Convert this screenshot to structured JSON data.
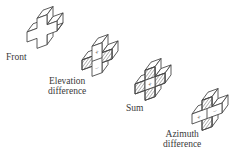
{
  "figure": {
    "type": "monopulse-antenna-quadrants",
    "stroke_color": "#444444",
    "background": "#ffffff",
    "panels": [
      {
        "id": "front",
        "label_lines": [
          "Front"
        ],
        "signs": []
      },
      {
        "id": "elevation",
        "label_lines": [
          "Elevation",
          "difference"
        ],
        "signs": [
          "+",
          "−"
        ]
      },
      {
        "id": "sum",
        "label_lines": [
          "Sum"
        ],
        "signs": [
          "+"
        ]
      },
      {
        "id": "azimuth",
        "label_lines": [
          "Azimuth",
          "difference"
        ],
        "signs": [
          "+",
          "−"
        ]
      }
    ]
  }
}
